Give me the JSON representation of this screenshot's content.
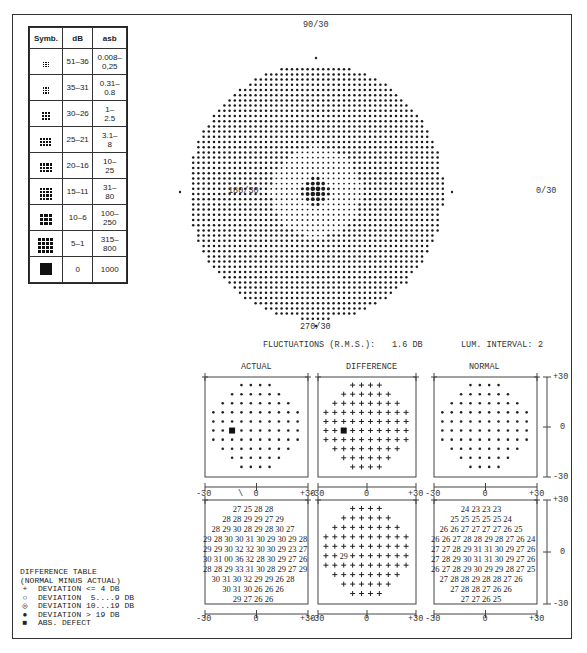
{
  "legend": {
    "headers": [
      "Symb.",
      "dB",
      "asb"
    ],
    "rows": [
      {
        "symbol": "dots-3x3-sparse",
        "db": "51–36",
        "asb": "0.008–\n0,25",
        "density": 1
      },
      {
        "symbol": "dots-3x3-light",
        "db": "35–31",
        "asb": "0.31–\n0.8",
        "density": 2
      },
      {
        "symbol": "dots-3x3",
        "db": "30–26",
        "asb": "1–\n2.5",
        "density": 3
      },
      {
        "symbol": "dots-4x3",
        "db": "25–21",
        "asb": "3.1–\n8",
        "density": 4
      },
      {
        "symbol": "dots-4x4-light",
        "db": "20–16",
        "asb": "10–\n25",
        "density": 5
      },
      {
        "symbol": "dots-4x4",
        "db": "15–11",
        "asb": "31–\n80",
        "density": 6
      },
      {
        "symbol": "dots-4x4-heavy",
        "db": "10–6",
        "asb": "100–\n250",
        "density": 7
      },
      {
        "symbol": "dots-4x4-dense",
        "db": "5–1",
        "asb": "315–\n800",
        "density": 8
      },
      {
        "symbol": "solid-square",
        "db": "0",
        "asb": "1000",
        "density": 9
      }
    ]
  },
  "greyscale_plot": {
    "labels": {
      "top": "90/30",
      "left": "180/30",
      "right": "0/30",
      "bottom": "270/30"
    },
    "scotoma": {
      "cx": 316,
      "cy": 191,
      "r": 14
    },
    "faint_zone": {
      "cx": 488,
      "cy": 172,
      "r": 22
    }
  },
  "stats": {
    "fluctuations_label": "FLUCTUATIONS (R.M.S.):",
    "fluctuations_value": "1.6 DB",
    "lum_interval_label": "LUM. INTERVAL:",
    "lum_interval_value": "2"
  },
  "panels": {
    "actual_title": "ACTUAL",
    "difference_title": "DIFFERENCE",
    "normal_title": "NORMAL",
    "x_ticks": [
      "-30",
      "0",
      "+30"
    ],
    "y_ticks": [
      "+30",
      "0",
      "-30"
    ],
    "row_lengths": [
      4,
      6,
      8,
      10,
      10,
      10,
      10,
      8,
      6,
      4
    ]
  },
  "actual_values": [
    "27 25 28 28",
    "28 28 29 29 27 29",
    "28 29 30 28 29 28 30 27",
    "29 28 30 30 31 30 29 30 29 28",
    "29 29 30 32 32 30 30 29 23 27",
    "30 31 00 36 32 28 30 29 27 26",
    "28 28 29 33 31 30 28 29 27 29",
    "30 31 30 32 29 29 26 28",
    "30 31 30 26 26 26",
    "29 27 26 26"
  ],
  "difference_values": [
    "+ + + +",
    "+ + + + + +",
    "+ + + + + + + +",
    "+ + + + + + + + + +",
    "+ + + + + + + + + +",
    "+ + 29 + + + + + + +",
    "+ + + + + + + + + +",
    "+ + + + + + + +",
    "+ + + + + +",
    "+ + + +"
  ],
  "normal_values": [
    "24 23 23 23",
    "25 25 25 25 25 24",
    "26 26 27 27 27 27 26 25",
    "26 26 27 28 28 29 28 27 26 24",
    "27 27 28 29 31 31 30 29 27 26",
    "27 28 29 30 31 31 30 29 27 26",
    "26 27 28 29 30 29 29 28 27 25",
    "27 28 28 29 28 28 27 26",
    "27 28 28 27 26 26",
    "27 27 26 25"
  ],
  "difference_table_legend": {
    "title": "DIFFERENCE TABLE",
    "subtitle": "(NORMAL MINUS ACTUAL)",
    "items": [
      {
        "glyph": "+",
        "text": "DEVIATION <= 4 DB"
      },
      {
        "glyph": "○",
        "text": "DEVIATION  5....9 DB"
      },
      {
        "glyph": "◎",
        "text": "DEVIATION 10...19 DB"
      },
      {
        "glyph": "●",
        "text": "DEVIATION > 19 DB"
      },
      {
        "glyph": "■",
        "text": "ABS. DEFECT"
      }
    ]
  },
  "colors": {
    "ink": "#222222",
    "paper": "#ffffff"
  }
}
